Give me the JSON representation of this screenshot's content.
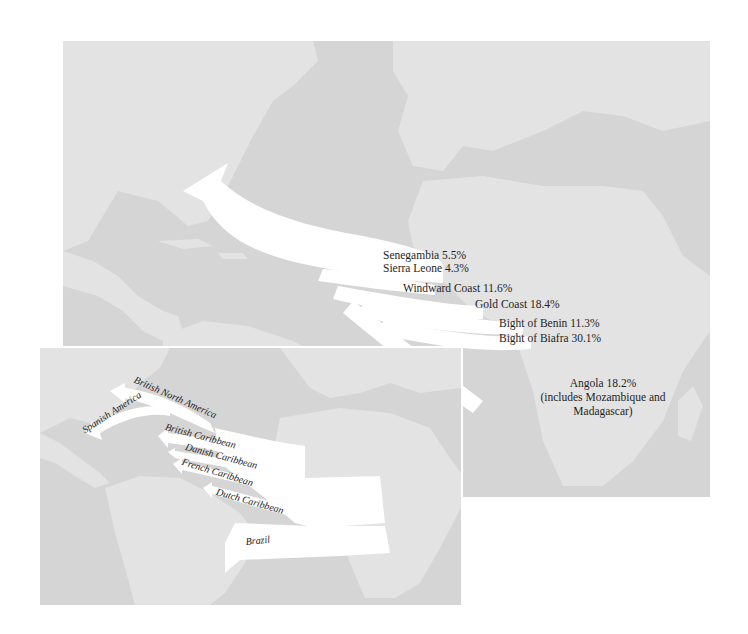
{
  "main_map": {
    "title": "Origins of enslaved Africans by African coastal region",
    "colors": {
      "ocean": "#d5d5d5",
      "land": "#e3e3e3",
      "flow": "#ffffff",
      "text": "#1e1e1e"
    },
    "regions": [
      {
        "name": "Senegambia",
        "percent": "5.5%",
        "label": "Senegambia 5.5%"
      },
      {
        "name": "Sierra Leone",
        "percent": "4.3%",
        "label": "Sierra Leone 4.3%"
      },
      {
        "name": "Windward Coast",
        "percent": "11.6%",
        "label": "Windward Coast 11.6%"
      },
      {
        "name": "Gold Coast",
        "percent": "18.4%",
        "label": "Gold Coast 18.4%"
      },
      {
        "name": "Bight of Benin",
        "percent": "11.3%",
        "label": "Bight of Benin 11.3%"
      },
      {
        "name": "Bight of Biafra",
        "percent": "30.1%",
        "label": "Bight of Biafra 30.1%"
      },
      {
        "name": "Angola",
        "percent": "18.2%",
        "label": "Angola 18.2%",
        "note": "(includes Mozambique and Madagascar)"
      }
    ]
  },
  "inset_map": {
    "destinations": [
      {
        "label": "British North America"
      },
      {
        "label": "Spanish America"
      },
      {
        "label": "British Caribbean"
      },
      {
        "label": "Danish Caribbean"
      },
      {
        "label": "French Caribbean"
      },
      {
        "label": "Dutch Caribbean"
      },
      {
        "label": "Brazil"
      }
    ]
  }
}
